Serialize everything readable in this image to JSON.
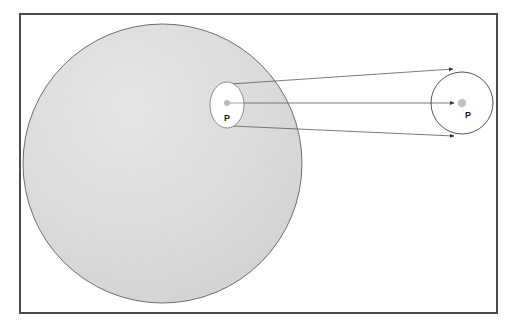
{
  "figure": {
    "background_color": "#ffffff",
    "frame": {
      "name": "figure-border",
      "x": 19,
      "y": 13,
      "width": 478,
      "height": 300,
      "stroke_color": "#4a4a4a",
      "stroke_width": 2,
      "fill": "#ffffff"
    },
    "shapes": {
      "large_sphere": {
        "label": "large shaded sphere",
        "cx": 162.5,
        "cy": 163.5,
        "r": 139.5,
        "fill_color": "#d9d9d9",
        "stroke_color": "#6e6e6e",
        "stroke_width": 1
      },
      "inner_ellipse": {
        "label": "small white ellipse on sphere",
        "cx": 227,
        "cy": 105,
        "rx": 17,
        "ry": 23,
        "fill_color": "#ffffff",
        "stroke_color": "#808080",
        "stroke_width": 1
      },
      "right_circle": {
        "label": "projected image circle",
        "cx": 462,
        "cy": 103,
        "r": 31,
        "fill_color": "#ffffff",
        "stroke_color": "#555555",
        "stroke_width": 1
      }
    },
    "points": [
      {
        "name": "point-p-source",
        "label": "P",
        "dot_cx": 227,
        "dot_cy": 103,
        "dot_r": 3,
        "dot_color": "#b3b3b3",
        "label_x": 227,
        "label_y": 120
      },
      {
        "name": "point-p-projected",
        "label": "P",
        "dot_cx": 462,
        "dot_cy": 103,
        "dot_r": 4,
        "dot_color": "#b3b3b3",
        "label_x": 468,
        "label_y": 117
      }
    ],
    "projection_rays": [
      {
        "name": "ray-top",
        "x1": 231,
        "y1": 84,
        "x2": 455,
        "y2": 69,
        "stroke_color": "#6b6b6b",
        "stroke_width": 0.9,
        "arrowhead": true
      },
      {
        "name": "ray-center",
        "x1": 228,
        "y1": 103,
        "x2": 456,
        "y2": 103,
        "stroke_color": "#6b6b6b",
        "stroke_width": 0.9,
        "arrowhead": true
      },
      {
        "name": "ray-bottom",
        "x1": 231,
        "y1": 126,
        "x2": 456,
        "y2": 136,
        "stroke_color": "#6b6b6b",
        "stroke_width": 0.9,
        "arrowhead": true
      }
    ],
    "colors": {
      "sphere_fill": "#d9d9d9",
      "frame_stroke": "#4a4a4a",
      "ray_stroke": "#6b6b6b",
      "dot_fill": "#b3b3b3",
      "label_text": "#1a1a1a"
    }
  }
}
